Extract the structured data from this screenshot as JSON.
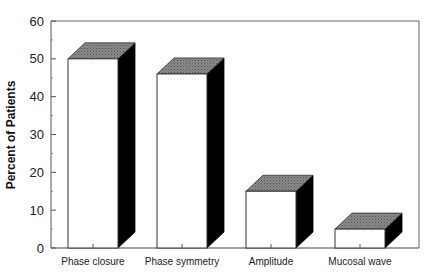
{
  "chart_data": {
    "type": "bar",
    "style": "3d-box",
    "title": "",
    "xlabel": "",
    "ylabel": "Percent of Patients",
    "ylim": [
      0,
      60
    ],
    "yticks": [
      0,
      10,
      20,
      30,
      40,
      50,
      60
    ],
    "categories": [
      "Phase closure",
      "Phase symmetry",
      "Amplitude",
      "Mucosal wave"
    ],
    "values": [
      50,
      46,
      15,
      5
    ],
    "grid": false,
    "legend": null,
    "colors": {
      "bar_front": "#ffffff",
      "bar_top": "#7a7a7a",
      "bar_side": "#000000",
      "axis": "#555555"
    }
  }
}
